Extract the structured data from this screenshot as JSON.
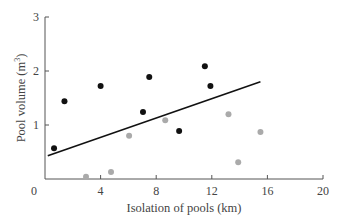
{
  "chart_data": {
    "type": "scatter",
    "title": "",
    "xlabel": "Isolation of pools (km)",
    "ylabel": "Pool volume (m",
    "ylabel_sup": "3",
    "ylabel_end": ")",
    "xlim": [
      0,
      20
    ],
    "ylim": [
      0,
      3
    ],
    "x_ticks": [
      0,
      4,
      8,
      12,
      16,
      20
    ],
    "y_ticks": [
      0,
      1,
      2,
      3
    ],
    "grid": false,
    "series": [
      {
        "name": "black",
        "color": "#111111",
        "points": [
          [
            0.65,
            0.57
          ],
          [
            1.4,
            1.44
          ],
          [
            4.0,
            1.72
          ],
          [
            7.5,
            1.89
          ],
          [
            7.05,
            1.24
          ],
          [
            9.65,
            0.89
          ],
          [
            11.5,
            2.09
          ],
          [
            11.9,
            1.72
          ]
        ]
      },
      {
        "name": "gray",
        "color": "#aaaaaa",
        "points": [
          [
            2.95,
            0.04
          ],
          [
            4.75,
            0.13
          ],
          [
            6.05,
            0.8
          ],
          [
            8.65,
            1.09
          ],
          [
            13.2,
            1.2
          ],
          [
            15.5,
            0.87
          ],
          [
            13.9,
            0.31
          ]
        ]
      }
    ],
    "trend_line": {
      "color": "#111111",
      "start": [
        0.2,
        0.43
      ],
      "end": [
        15.5,
        1.8
      ]
    }
  }
}
